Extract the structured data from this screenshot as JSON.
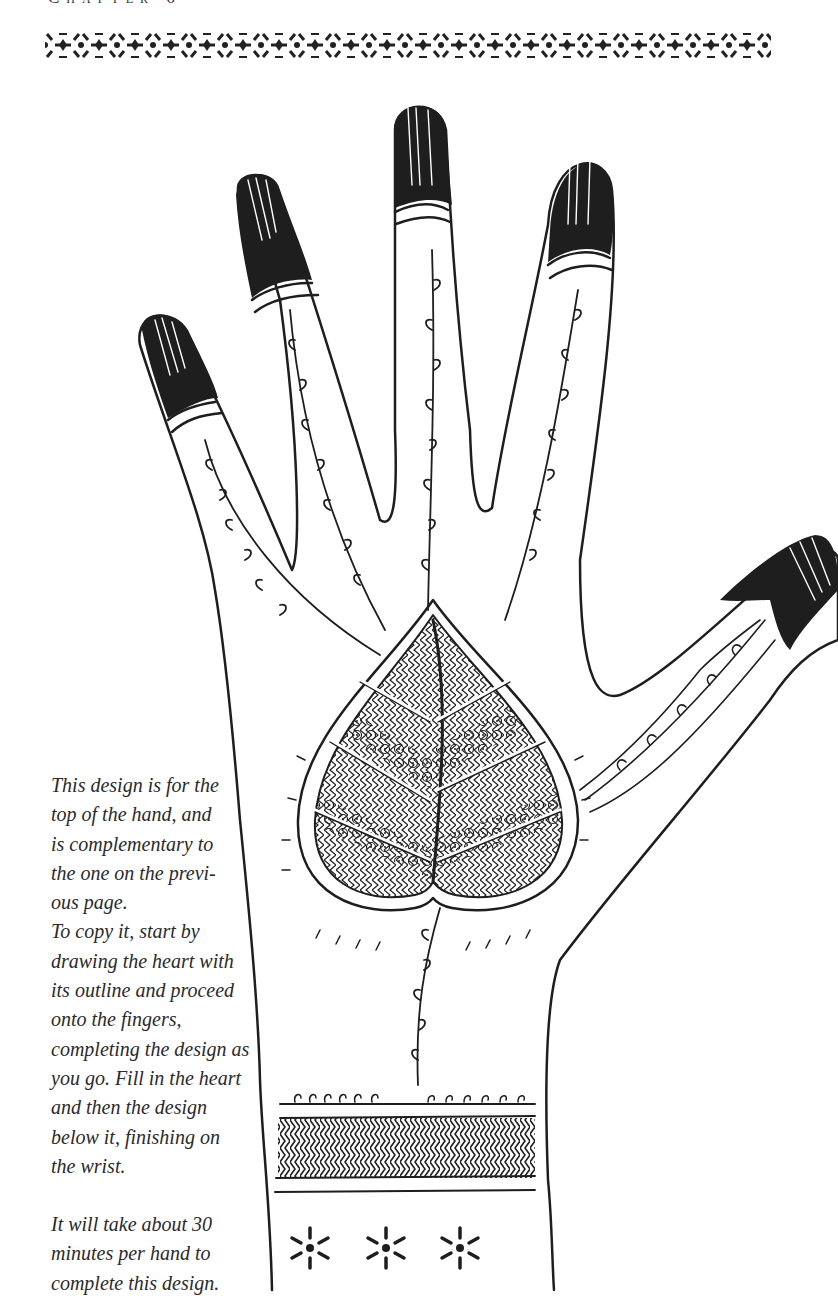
{
  "page": {
    "header": "Chapter 6",
    "caption": {
      "lines_para1": [
        "This design is for the",
        "top of the hand, and",
        "is complementary to",
        "the one on the previ-",
        "ous page.",
        "To copy it, start by",
        "drawing the heart with",
        "its outline and proceed",
        "onto the fingers,",
        "completing the design as",
        "you go. Fill in the heart",
        "and then the design",
        "below it, finishing on",
        "the wrist."
      ],
      "lines_para2": [
        "It will take about 30",
        "minutes per hand to",
        "complete this design."
      ]
    },
    "illustration": {
      "subject": "henna-hand-design",
      "ink_color": "#1e1e1e",
      "paper_color": "#ffffff",
      "elements": [
        "decorative-border-band",
        "hand-outline",
        "fingertip-caps",
        "vine-scrolls",
        "heart-leaf-motif",
        "thumb-scallop-vine",
        "wrist-chevron-band",
        "wrist-star-flowers"
      ]
    }
  }
}
